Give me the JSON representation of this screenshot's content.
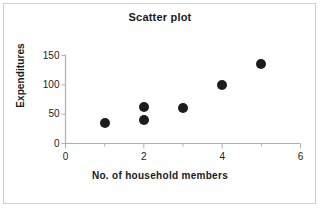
{
  "chart_data": {
    "type": "scatter",
    "title": "Scatter plot",
    "xlabel": "No. of household members",
    "ylabel": "Expenditures",
    "xlim": [
      0,
      6
    ],
    "ylim": [
      0,
      150
    ],
    "xticks": [
      "0",
      "2",
      "4",
      "6"
    ],
    "xtick_values": [
      0,
      2,
      4,
      6
    ],
    "yticks": [
      "0",
      "50",
      "100",
      "150"
    ],
    "ytick_values": [
      0,
      50,
      100,
      150
    ],
    "x_minor_ticks": [
      1,
      3,
      5
    ],
    "grid": false,
    "legend": null,
    "marker": {
      "shape": "circle",
      "filled": true,
      "color": "#1c1c1c",
      "size_px": 10
    },
    "axis_color": "#b0b0b0",
    "points": [
      {
        "x": 1,
        "y": 35
      },
      {
        "x": 2,
        "y": 62
      },
      {
        "x": 2,
        "y": 40
      },
      {
        "x": 3,
        "y": 60
      },
      {
        "x": 4,
        "y": 100
      },
      {
        "x": 5,
        "y": 136
      }
    ]
  }
}
